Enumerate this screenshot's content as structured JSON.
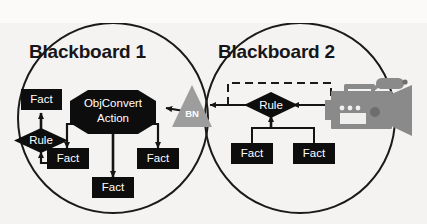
{
  "figure": {
    "type": "diagram",
    "subtype": "blackboard-architecture-venn",
    "background_color": "#f4f3f1",
    "stroke_color": "#1a1a1a",
    "node_fill": "#0d0d0d",
    "node_text_color": "#ffffff",
    "accent_gray": "#9d9d9d",
    "camera_gray": "#8a8a8a"
  },
  "blackboards": [
    {
      "id": "bb1",
      "title": "Blackboard 1",
      "cx": 113,
      "cy": 118,
      "r": 95
    },
    {
      "id": "bb2",
      "title": "Blackboard 2",
      "cx": 300,
      "cy": 118,
      "r": 95
    }
  ],
  "nodes": {
    "bb1": {
      "fact_top": {
        "label": "Fact",
        "shape": "rect"
      },
      "rule": {
        "label": "Rule",
        "shape": "diamond"
      },
      "action": {
        "label_line1": "ObjConvert",
        "label_line2": "Action",
        "shape": "octagon"
      },
      "fact_left": {
        "label": "Fact",
        "shape": "rect"
      },
      "fact_right": {
        "label": "Fact",
        "shape": "rect"
      },
      "fact_bottom": {
        "label": "Fact",
        "shape": "rect"
      }
    },
    "bridge": {
      "bn": {
        "label": "BN",
        "shape": "triangle",
        "fill": "#9d9d9d"
      }
    },
    "bb2": {
      "rule": {
        "label": "Rule",
        "shape": "diamond"
      },
      "fact_left": {
        "label": "Fact",
        "shape": "rect"
      },
      "fact_right": {
        "label": "Fact",
        "shape": "rect"
      },
      "camera": {
        "name": "video-camera-icon",
        "fill": "#8a8a8a"
      },
      "feedback_box": {
        "style": "dashed",
        "stroke": "#1a1a1a"
      }
    }
  },
  "edges": [
    {
      "from": "bb1.rule",
      "to": "bb1.fact_top",
      "style": "solid-arrow"
    },
    {
      "from": "bb1.fact_left",
      "to": "bb1.rule",
      "style": "solid-arrow"
    },
    {
      "from": "bb1.action",
      "to": "bb1.fact_left",
      "style": "solid-arrow"
    },
    {
      "from": "bb1.action",
      "to": "bb1.fact_bottom",
      "style": "solid-arrow"
    },
    {
      "from": "bb1.action",
      "to": "bb1.fact_right",
      "style": "solid-arrow"
    },
    {
      "from": "bridge.bn",
      "to": "bb1.action",
      "style": "solid-arrow"
    },
    {
      "from": "bb2.rule",
      "to": "bridge.bn",
      "style": "solid-arrow"
    },
    {
      "from": "bb2.camera",
      "to": "bb2.rule",
      "style": "solid-arrow"
    },
    {
      "from": "bb2.fact_left",
      "to": "bb2.rule",
      "style": "solid-arrow"
    },
    {
      "from": "bb2.fact_right",
      "to": "bb2.rule",
      "style": "solid-arrow"
    },
    {
      "from": "bb2.camera",
      "to": "bridge.bn",
      "style": "dashed-feedback"
    }
  ]
}
